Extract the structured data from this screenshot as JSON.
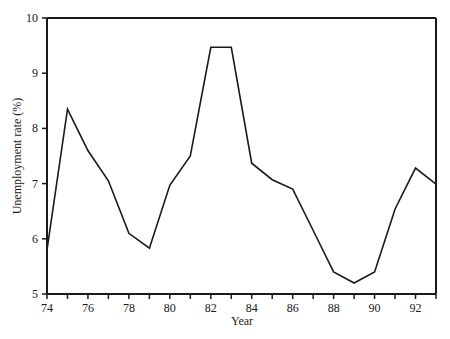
{
  "chart_data": {
    "type": "line",
    "title": "",
    "xlabel": "Year",
    "ylabel": "Unemployment rate (%)",
    "x": [
      74,
      75,
      76,
      77,
      78,
      79,
      80,
      81,
      82,
      83,
      84,
      85,
      86,
      87,
      88,
      89,
      90,
      91,
      92,
      93
    ],
    "series": [
      {
        "name": "Unemployment rate",
        "values": [
          5.8,
          8.35,
          7.6,
          7.05,
          6.1,
          5.83,
          6.97,
          7.5,
          9.47,
          9.47,
          7.37,
          7.07,
          6.9,
          6.15,
          5.4,
          5.2,
          5.4,
          6.54,
          7.28,
          6.99
        ]
      }
    ],
    "xlim": [
      74,
      93
    ],
    "ylim": [
      5,
      10
    ],
    "x_tick_labels": [
      "74",
      "76",
      "78",
      "80",
      "82",
      "84",
      "86",
      "88",
      "90",
      "92"
    ],
    "x_ticks_minor": [
      75,
      77,
      79,
      81,
      83,
      85,
      87,
      89,
      91,
      93
    ],
    "y_tick_labels": [
      "5",
      "6",
      "7",
      "8",
      "9",
      "10"
    ],
    "grid": false,
    "legend": "none",
    "colors": {
      "line": "#1a1a1a",
      "axis": "#1a1a1a",
      "background": "#ffffff"
    }
  }
}
